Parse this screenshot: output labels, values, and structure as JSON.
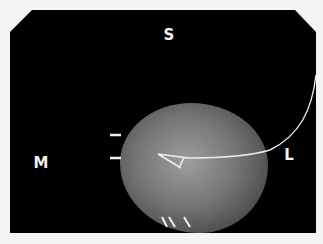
{
  "image": {
    "type": "specimen radiograph",
    "orientation_labels": {
      "superior": "S",
      "medial": "M",
      "lateral": "L"
    },
    "features": [
      "localization-wire",
      "wire-hook",
      "edge-marker-clips-left",
      "edge-marker-clips-bottom"
    ]
  }
}
